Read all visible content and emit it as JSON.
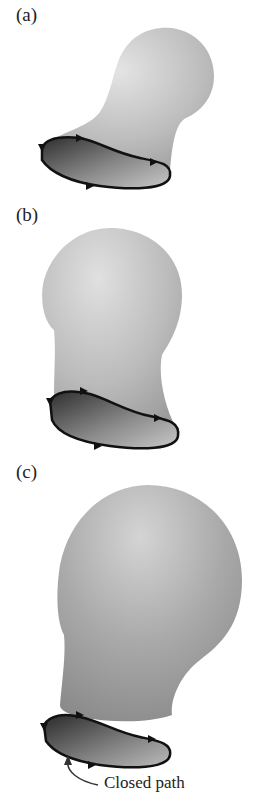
{
  "figure": {
    "panels": [
      {
        "label": "(a)",
        "surface": "small bulb tilted right"
      },
      {
        "label": "(b)",
        "surface": "medium bulb upright"
      },
      {
        "label": "(c)",
        "surface": "large bulb"
      }
    ],
    "callout": {
      "text": "Closed path"
    },
    "colors": {
      "surface_light": "#e2e2e2",
      "surface_mid": "#b5b5b5",
      "surface_dark": "#8f8f8f",
      "opening_dark": "#3a3a3a",
      "path_stroke": "#111111"
    }
  }
}
